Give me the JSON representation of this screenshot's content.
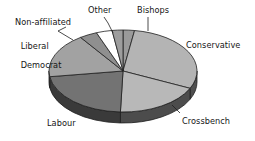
{
  "chart_data": {
    "type": "pie",
    "title": "",
    "subtitle": "",
    "xlabel": "",
    "ylabel": "",
    "legend_position": "none",
    "grid": false,
    "three_d": true,
    "labels_outside": true,
    "categories": [
      "Bishops",
      "Conservative",
      "Crossbench",
      "Labour",
      "Liberal Democrat",
      "Non-affiliated",
      "Other"
    ],
    "values": [
      2.5,
      29.5,
      24.0,
      25.0,
      12.0,
      4.0,
      3.0
    ],
    "slices": [
      {
        "name": "Bishops",
        "value": 2.5,
        "color": "#9a9a9a",
        "side_color": "#4a4a4a",
        "start_deg": 0.0,
        "end_deg": 9.0
      },
      {
        "name": "Conservative",
        "value": 29.5,
        "color": "#b4b4b4",
        "side_color": "#4f4f4f",
        "start_deg": 9.0,
        "end_deg": 115.0
      },
      {
        "name": "Crossbench",
        "value": 24.0,
        "color": "#b8b8b8",
        "side_color": "#4c4c4c",
        "start_deg": 115.0,
        "end_deg": 182.0
      },
      {
        "name": "Labour",
        "value": 25.0,
        "color": "#737373",
        "side_color": "#3a3a3a",
        "start_deg": 182.0,
        "end_deg": 262.0
      },
      {
        "name": "Liberal Democrat",
        "value": 12.0,
        "color": "#a2a2a2",
        "side_color": "#444444",
        "start_deg": 262.0,
        "end_deg": 325.0
      },
      {
        "name": "Non-affiliated",
        "value": 4.0,
        "color": "#8f8f8f",
        "side_color": "#434343",
        "start_deg": 325.0,
        "end_deg": 339.0
      },
      {
        "name": "Other",
        "value": 3.0,
        "color": "#ffffff",
        "side_color": "#555555",
        "start_deg": 339.0,
        "end_deg": 351.5
      },
      {
        "name": "Bishops2",
        "value": 2.5,
        "color": "#9d9d9d",
        "side_color": "#474747",
        "start_deg": 351.5,
        "end_deg": 360.0
      }
    ],
    "labels": {
      "conservative": "Conservative",
      "crossbench": "Crossbench",
      "labour": "Labour",
      "liberal_democrat_line1": "Liberal",
      "liberal_democrat_line2": "Democrat",
      "non_affiliated": "Non-affiliated",
      "other": "Other",
      "bishops": "Bishops"
    },
    "colors": {
      "outline": "#1f1f1f",
      "background": "#ffffff",
      "text": "#161616",
      "leader_line": "#1f1f1f"
    },
    "geometry": {
      "center_x": 123,
      "center_y": 71,
      "radius_x": 74,
      "radius_y": 41,
      "depth": 11
    }
  }
}
